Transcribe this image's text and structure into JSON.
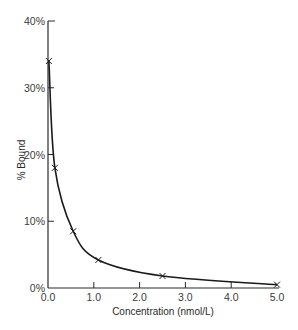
{
  "chart_data": {
    "type": "line",
    "title": "",
    "xlabel": "Concentration (nmol/L)",
    "ylabel": "% Bound",
    "xlim": [
      0,
      5
    ],
    "ylim": [
      0,
      40
    ],
    "x_ticks": [
      "0.0",
      "1.0",
      "2.0",
      "3.0",
      "4.0",
      "5.0"
    ],
    "y_ticks": [
      "0%",
      "10%",
      "20%",
      "30%",
      "40%"
    ],
    "grid": false,
    "legend": null,
    "series": [
      {
        "name": "% Bound",
        "marker": "x",
        "points": [
          {
            "x": 0.02,
            "y": 34
          },
          {
            "x": 0.15,
            "y": 18
          },
          {
            "x": 0.55,
            "y": 8.5
          },
          {
            "x": 1.1,
            "y": 4.2
          },
          {
            "x": 2.5,
            "y": 1.8
          },
          {
            "x": 5.0,
            "y": 0.5
          }
        ]
      }
    ]
  },
  "axes": {
    "x_label": "Concentration (nmol/L)",
    "y_label": "% Bound",
    "x_ticks": [
      "0.0",
      "1.0",
      "2.0",
      "3.0",
      "4.0",
      "5.0"
    ],
    "y_ticks": [
      "0%",
      "10%",
      "20%",
      "30%",
      "40%"
    ]
  }
}
